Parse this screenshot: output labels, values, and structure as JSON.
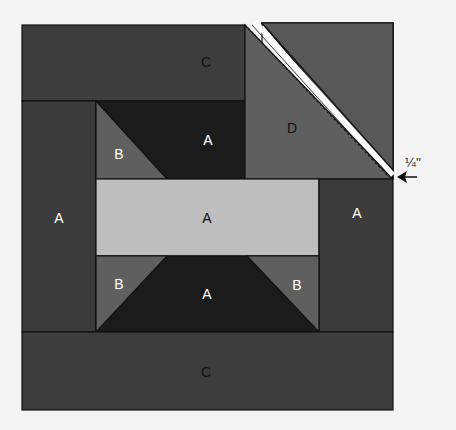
{
  "diagram": {
    "title": "",
    "type": "quilt-block-piecing-diagram",
    "colors": {
      "background": "#f4f4f4",
      "outline": "#111111",
      "c_panel": "#3d3d3d",
      "a_side": "#3b3b3b",
      "a_dark": "#1b1b1b",
      "a_light": "#bebebe",
      "b_triangle": "#5f5f5f",
      "d_triangle": "#5f5f5f",
      "d_square_back": "#585858",
      "seam_line": "#ffffff",
      "stitch_line": "#1a1a1a",
      "label_light": "#ffffff",
      "label_dark": "#111111"
    },
    "pieces": {
      "top_c": {
        "label": "C"
      },
      "left_a": {
        "label": "A"
      },
      "right_a": {
        "label": "A"
      },
      "top_center_a": {
        "label": "A"
      },
      "center_a": {
        "label": "A"
      },
      "bottom_center_a": {
        "label": "A"
      },
      "top_left_b": {
        "label": "B"
      },
      "bottom_left_b": {
        "label": "B"
      },
      "bottom_right_b": {
        "label": "B"
      },
      "corner_d": {
        "label": "D"
      },
      "bottom_c": {
        "label": "C"
      }
    },
    "annotation": {
      "seam_allowance_label": "¼''",
      "arrow": "left-arrow"
    }
  }
}
